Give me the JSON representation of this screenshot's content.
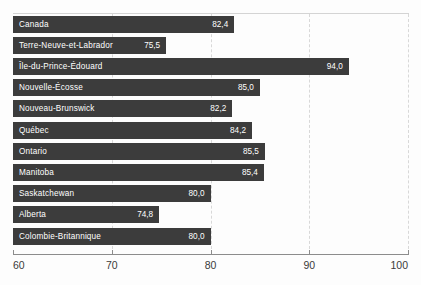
{
  "chart_data": {
    "type": "bar",
    "orientation": "horizontal",
    "title": "",
    "subtitle": "",
    "xlabel": "",
    "ylabel": "",
    "xlim": [
      60,
      100
    ],
    "grid": true,
    "grid_axis": "x",
    "legend": false,
    "decimal_separator": ",",
    "bar_color": "#3c3c3c",
    "label_color": "#ffffff",
    "axis_color": "#8c8c8c",
    "gridline_color": "#d8d8d8",
    "background_color": "#fdfdfd",
    "xticks": [
      60,
      70,
      80,
      90,
      100
    ],
    "xtick_labels": [
      "60",
      "70",
      "80",
      "90",
      "100"
    ],
    "categories": [
      "Canada",
      "Terre-Neuve-et-Labrador",
      "Île-du-Prince-Édouard",
      "Nouvelle-Écosse",
      "Nouveau-Brunswick",
      "Québec",
      "Ontario",
      "Manitoba",
      "Saskatchewan",
      "Alberta",
      "Colombie-Britannique"
    ],
    "values": [
      82.4,
      75.5,
      94.0,
      85.0,
      82.2,
      84.2,
      85.5,
      85.4,
      80.0,
      74.8,
      80.0
    ],
    "value_labels": [
      "82,4",
      "75,5",
      "94,0",
      "85,0",
      "82,2",
      "84,2",
      "85,5",
      "85,4",
      "80,0",
      "74,8",
      "80,0"
    ],
    "bars": [
      {
        "category": "Canada",
        "value": 82.4,
        "value_label": "82,4"
      },
      {
        "category": "Terre-Neuve-et-Labrador",
        "value": 75.5,
        "value_label": "75,5"
      },
      {
        "category": "Île-du-Prince-Édouard",
        "value": 94.0,
        "value_label": "94,0"
      },
      {
        "category": "Nouvelle-Écosse",
        "value": 85.0,
        "value_label": "85,0"
      },
      {
        "category": "Nouveau-Brunswick",
        "value": 82.2,
        "value_label": "82,2"
      },
      {
        "category": "Québec",
        "value": 84.2,
        "value_label": "84,2"
      },
      {
        "category": "Ontario",
        "value": 85.5,
        "value_label": "85,5"
      },
      {
        "category": "Manitoba",
        "value": 85.4,
        "value_label": "85,4"
      },
      {
        "category": "Saskatchewan",
        "value": 80.0,
        "value_label": "80,0"
      },
      {
        "category": "Alberta",
        "value": 74.8,
        "value_label": "74,8"
      },
      {
        "category": "Colombie-Britannique",
        "value": 80.0,
        "value_label": "80,0"
      }
    ]
  }
}
